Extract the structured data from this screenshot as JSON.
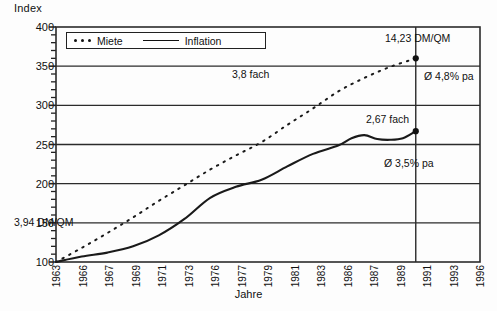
{
  "chart_data": {
    "type": "line",
    "title": "",
    "xlabel": "Jahre",
    "ylabel": "Index",
    "ylim": [
      100,
      400
    ],
    "xlim": [
      1963,
      1996
    ],
    "yticks": [
      100,
      150,
      200,
      250,
      300,
      350,
      400
    ],
    "grid": true,
    "minor_tick_step": 10,
    "legend_position": "top-left-inside",
    "categories": [
      "1963",
      "1966",
      "1967",
      "1969",
      "1971",
      "1973",
      "1976",
      "1977",
      "1979",
      "1981",
      "1983",
      "1986",
      "1987",
      "1989",
      "1991",
      "1993",
      "1996"
    ],
    "series": [
      {
        "name": "Miete",
        "style": "dotted",
        "x": [
          1963,
          1965,
          1967,
          1969,
          1971,
          1973,
          1975,
          1977,
          1979,
          1981,
          1983,
          1985,
          1987,
          1989,
          1991
        ],
        "values": [
          100,
          118,
          137,
          157,
          178,
          198,
          218,
          236,
          253,
          275,
          296,
          318,
          335,
          349,
          360
        ]
      },
      {
        "name": "Inflation",
        "style": "solid",
        "x": [
          1963,
          1965,
          1967,
          1969,
          1971,
          1973,
          1975,
          1977,
          1979,
          1981,
          1983,
          1985,
          1986,
          1987,
          1988,
          1989,
          1990,
          1991
        ],
        "values": [
          100,
          107,
          112,
          120,
          134,
          155,
          182,
          196,
          205,
          222,
          238,
          249,
          258,
          262,
          257,
          256,
          258,
          267
        ]
      }
    ],
    "annotations": [
      {
        "id": "start-value",
        "text": "3,94 DM/QM",
        "x": 1963,
        "y": 143
      },
      {
        "id": "miete-end",
        "text": "14,23 DM/QM",
        "x": 1991,
        "y": 385
      },
      {
        "id": "miete-factor",
        "text": "3,8 fach",
        "x": 1977,
        "y": 332
      },
      {
        "id": "miete-rate",
        "text": "Ø 4,8% pa",
        "x": 1991,
        "y": 328
      },
      {
        "id": "infl-factor",
        "text": "2,67 fach",
        "x": 1987,
        "y": 283
      },
      {
        "id": "infl-rate",
        "text": "Ø 3,5% pa",
        "x": 1991,
        "y": 225
      }
    ],
    "markers": [
      {
        "series": "Miete",
        "x": 1991,
        "y": 360
      },
      {
        "series": "Inflation",
        "x": 1991,
        "y": 267
      }
    ],
    "reference_line": {
      "x": 1991,
      "label": "1991"
    },
    "colors": {
      "line": "#1a1a1a",
      "grid": "#2b2b2b",
      "background": "#fdfdfd"
    }
  },
  "legend": {
    "miete_label": "Miete",
    "inflation_label": "Inflation"
  }
}
